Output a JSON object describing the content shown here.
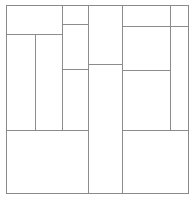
{
  "figure": {
    "title": "",
    "kind": "rectangle-partition-diagram",
    "width": 194,
    "height": 201,
    "background_color": "#ffffff",
    "line_color": "#8c8c8c",
    "border_color": "#8a8a8a",
    "line_width": 1
  },
  "border": {
    "name": "outer-frame",
    "x1": 6,
    "y1": 5,
    "x2": 188,
    "y2": 193
  },
  "segments": [
    {
      "id": "v-col-a",
      "orientation": "vertical",
      "x": 35,
      "from": 34,
      "to": 130
    },
    {
      "id": "v-col-b",
      "orientation": "vertical",
      "x": 62,
      "from": 5,
      "to": 130
    },
    {
      "id": "v-col-c",
      "orientation": "vertical",
      "x": 88,
      "from": 5,
      "to": 193
    },
    {
      "id": "v-col-d",
      "orientation": "vertical",
      "x": 122,
      "from": 5,
      "to": 193
    },
    {
      "id": "v-col-e",
      "orientation": "vertical",
      "x": 170,
      "from": 5,
      "to": 130
    },
    {
      "id": "h-top-mid",
      "orientation": "horizontal",
      "y": 24,
      "from": 62,
      "to": 88
    },
    {
      "id": "h-top-right",
      "orientation": "horizontal",
      "y": 26,
      "from": 122,
      "to": 188
    },
    {
      "id": "h-top-left",
      "orientation": "horizontal",
      "y": 34,
      "from": 6,
      "to": 62
    },
    {
      "id": "h-mid-c",
      "orientation": "horizontal",
      "y": 64,
      "from": 88,
      "to": 122
    },
    {
      "id": "h-mid-b",
      "orientation": "horizontal",
      "y": 69,
      "from": 62,
      "to": 88
    },
    {
      "id": "h-mid-right",
      "orientation": "horizontal",
      "y": 70,
      "from": 122,
      "to": 170
    },
    {
      "id": "h-low-left",
      "orientation": "horizontal",
      "y": 130,
      "from": 6,
      "to": 88
    },
    {
      "id": "h-low-right",
      "orientation": "horizontal",
      "y": 130,
      "from": 122,
      "to": 188
    }
  ],
  "cells": [
    {
      "id": "cell-top-left",
      "x": 6,
      "y": 5,
      "w": 56,
      "h": 29,
      "label": ""
    },
    {
      "id": "cell-left-narrow",
      "x": 6,
      "y": 34,
      "w": 29,
      "h": 96,
      "label": ""
    },
    {
      "id": "cell-left-wide",
      "x": 35,
      "y": 34,
      "w": 27,
      "h": 96,
      "label": ""
    },
    {
      "id": "cell-mid-top",
      "x": 62,
      "y": 5,
      "w": 26,
      "h": 19,
      "label": ""
    },
    {
      "id": "cell-mid-upper",
      "x": 62,
      "y": 24,
      "w": 26,
      "h": 45,
      "label": ""
    },
    {
      "id": "cell-mid-lower",
      "x": 62,
      "y": 69,
      "w": 26,
      "h": 61,
      "label": ""
    },
    {
      "id": "cell-center-top",
      "x": 88,
      "y": 5,
      "w": 34,
      "h": 59,
      "label": ""
    },
    {
      "id": "cell-center-bottom",
      "x": 88,
      "y": 64,
      "w": 34,
      "h": 129,
      "label": ""
    },
    {
      "id": "cell-right-top-left",
      "x": 122,
      "y": 5,
      "w": 48,
      "h": 21,
      "label": ""
    },
    {
      "id": "cell-right-top-right",
      "x": 170,
      "y": 5,
      "w": 18,
      "h": 21,
      "label": ""
    },
    {
      "id": "cell-right-mid-left",
      "x": 122,
      "y": 26,
      "w": 48,
      "h": 44,
      "label": ""
    },
    {
      "id": "cell-right-mid-right",
      "x": 170,
      "y": 26,
      "w": 18,
      "h": 104,
      "label": ""
    },
    {
      "id": "cell-right-lower",
      "x": 122,
      "y": 70,
      "w": 48,
      "h": 60,
      "label": ""
    },
    {
      "id": "cell-bottom-left",
      "x": 6,
      "y": 130,
      "w": 82,
      "h": 63,
      "label": ""
    },
    {
      "id": "cell-bottom-right",
      "x": 122,
      "y": 130,
      "w": 66,
      "h": 63,
      "label": ""
    }
  ]
}
